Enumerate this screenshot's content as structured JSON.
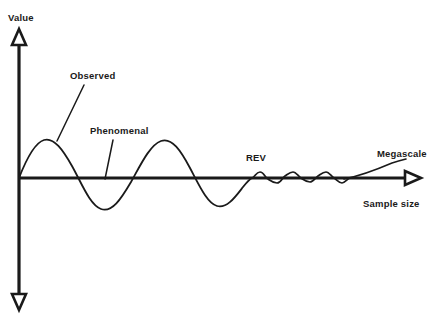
{
  "figure": {
    "kind": "damped-oscillation-rev-diagram",
    "background_color": "#ffffff",
    "line_color": "#1a1a1a",
    "axes": {
      "y_axis_label": "Value",
      "x_axis_label": "Sample size",
      "origin": {
        "x": 19,
        "y": 178
      },
      "y_axis_top": 28,
      "y_axis_bottom": 310,
      "x_axis_right": 420,
      "y_arrow_direction": "up",
      "y_arrow_direction_bottom": "down",
      "x_arrow_direction": "right",
      "arrow_style": "hollow-triangle"
    },
    "annotations": [
      {
        "id": "observed",
        "label": "Observed",
        "text_x": 70,
        "text_y": 79,
        "leader_from": {
          "x": 84,
          "y": 85
        },
        "leader_to": {
          "x": 57,
          "y": 141
        }
      },
      {
        "id": "phenomenal",
        "label": "Phenomenal",
        "text_x": 90,
        "text_y": 134,
        "leader_from": {
          "x": 113,
          "y": 140
        },
        "leader_to": {
          "x": 105,
          "y": 179
        }
      },
      {
        "id": "rev",
        "label": "REV",
        "text_x": 246,
        "text_y": 161,
        "leader_from": null,
        "leader_to": null
      },
      {
        "id": "megascale",
        "label": "Megascale",
        "text_x": 377,
        "text_y": 157,
        "leader_from": null,
        "leader_to": null
      }
    ],
    "x_axis_label_pos": {
      "x": 363,
      "y": 207
    },
    "y_axis_label_pos": {
      "x": 8,
      "y": 21
    }
  },
  "chart_data": {
    "type": "line",
    "title": "",
    "xlabel": "Sample size",
    "ylabel": "Value",
    "grid": false,
    "legend": false,
    "axis_ticks": [],
    "series": [
      {
        "name": "Observed",
        "note": "Damped oscillating curve from origin through REV into the megascale trend",
        "path_d": "M 19 178 C 26 160 34 143 44 140 C 54 137 63 150 72 166 C 82 184 90 205 101 209 C 112 213 121 199 131 182 C 141 164 150 145 161 141 C 172 137 181 151 190 168 C 199 185 207 203 217 206 C 227 209 236 196 243 187 C 247 182 250 179 252 178",
        "key_points": [
          {
            "x": 19,
            "y": 178,
            "kind": "origin"
          },
          {
            "x": 44,
            "y": 140,
            "kind": "peak-1"
          },
          {
            "x": 72,
            "y": 166,
            "kind": "zero-crossing"
          },
          {
            "x": 101,
            "y": 209,
            "kind": "trough-1"
          },
          {
            "x": 131,
            "y": 182,
            "kind": "zero-crossing"
          },
          {
            "x": 161,
            "y": 141,
            "kind": "peak-2"
          },
          {
            "x": 190,
            "y": 168,
            "kind": "zero-crossing"
          },
          {
            "x": 217,
            "y": 206,
            "kind": "trough-2"
          },
          {
            "x": 252,
            "y": 178,
            "kind": "rev-onset"
          }
        ]
      },
      {
        "name": "REV ripples",
        "note": "Low-amplitude residual oscillations across the representative elementary volume plateau",
        "path_d": "M 252 178 C 255 177 256 172 260 172 C 264 172 265 178 268 179 C 271 181 273 183 277 183 C 281 183 282 178 285 176 C 288 174 290 172 293 172 C 296 172 298 176 301 178 C 304 180 306 182 310 182 C 313 182 315 178 318 176 C 321 174 323 172 326 172 C 329 172 331 176 334 178 C 337 180 339 183 342 183 C 345 183 347 179 350 178"
      },
      {
        "name": "Megascale",
        "note": "Upward trend line rising away from the axis at large sample size",
        "path_d": "M 344 179 C 360 176 378 169 392 163 C 398 161 402 160 406 159",
        "key_points": [
          {
            "x": 344,
            "y": 179,
            "kind": "start"
          },
          {
            "x": 406,
            "y": 159,
            "kind": "end"
          }
        ]
      }
    ]
  }
}
